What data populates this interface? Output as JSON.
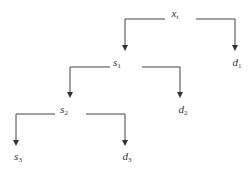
{
  "diagram": {
    "type": "binary-decomposition-tree",
    "nodes": [
      {
        "id": "xt",
        "base": "x",
        "sub": "t",
        "x": 175,
        "y": 14
      },
      {
        "id": "s1",
        "base": "s",
        "sub": "1",
        "x": 117,
        "y": 63
      },
      {
        "id": "d1",
        "base": "d",
        "sub": "1",
        "x": 237,
        "y": 63
      },
      {
        "id": "s2",
        "base": "s",
        "sub": "2",
        "x": 64,
        "y": 110
      },
      {
        "id": "d2",
        "base": "d",
        "sub": "2",
        "x": 183,
        "y": 110
      },
      {
        "id": "s3",
        "base": "s",
        "sub": "3",
        "x": 18,
        "y": 157
      },
      {
        "id": "d3",
        "base": "d",
        "sub": "3",
        "x": 127,
        "y": 157
      }
    ],
    "edges": [
      {
        "from": "xt",
        "to": "s1"
      },
      {
        "from": "xt",
        "to": "d1"
      },
      {
        "from": "s1",
        "to": "s2"
      },
      {
        "from": "s1",
        "to": "d2"
      },
      {
        "from": "s2",
        "to": "s3"
      },
      {
        "from": "s2",
        "to": "d3"
      }
    ],
    "colors": {
      "line": "#333333",
      "text": "#333333",
      "background": "#ffffff"
    }
  },
  "labels": {
    "xt": {
      "base": "x",
      "sub": "t"
    },
    "s1": {
      "base": "s",
      "sub": "1"
    },
    "d1": {
      "base": "d",
      "sub": "1"
    },
    "s2": {
      "base": "s",
      "sub": "2"
    },
    "d2": {
      "base": "d",
      "sub": "2"
    },
    "s3": {
      "base": "s",
      "sub": "3"
    },
    "d3": {
      "base": "d",
      "sub": "3"
    }
  }
}
